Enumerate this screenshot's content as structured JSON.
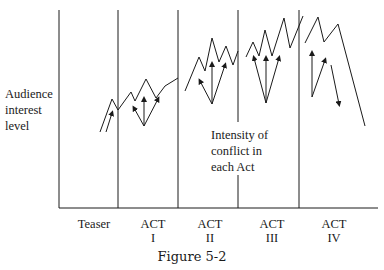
{
  "diagram": {
    "y_label": [
      "Audience",
      "interest",
      "level"
    ],
    "annotation": [
      "Intensity of",
      "conflict in",
      "each Act"
    ],
    "segments": [
      {
        "name": "Teaser",
        "lines": [
          "Teaser"
        ]
      },
      {
        "name": "ACT I",
        "lines": [
          "ACT",
          "I"
        ]
      },
      {
        "name": "ACT II",
        "lines": [
          "ACT",
          "II"
        ]
      },
      {
        "name": "ACT III",
        "lines": [
          "ACT",
          "III"
        ]
      },
      {
        "name": "ACT IV",
        "lines": [
          "ACT",
          "IV"
        ]
      }
    ],
    "caption": "Figure 5-2",
    "line_color": "#1a1a1a"
  }
}
